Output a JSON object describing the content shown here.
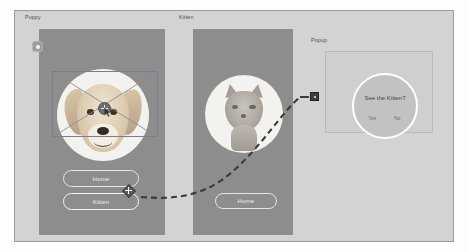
{
  "canvas": {
    "background_color": "#d3d3d3",
    "border_color": "#9a9a9a"
  },
  "frames": [
    {
      "name": "puppy-frame",
      "label": "Puppy",
      "is_home": true,
      "background_color": "#8d8d8d",
      "image_subject": "golden retriever puppy",
      "buttons": [
        {
          "name": "home-button",
          "label": "Home"
        },
        {
          "name": "kitten-button",
          "label": "Kitten",
          "has_connector": true
        }
      ]
    },
    {
      "name": "kitten-frame",
      "label": "Kitten",
      "is_home": false,
      "background_color": "#8d8d8d",
      "image_subject": "grey tabby kitten",
      "buttons": [
        {
          "name": "home-button",
          "label": "Home"
        }
      ]
    },
    {
      "name": "popup-frame",
      "label": "Popup",
      "background_color": "#cfcfcf",
      "modal": {
        "title": "See the Kitten?",
        "confirm_label": "Yes",
        "dismiss_label": "No"
      }
    }
  ],
  "connector": {
    "name": "kitten-button-to-popup",
    "style": "dashed",
    "color": "#3a3a3a",
    "source_handle": "move-plus-handle",
    "target_marker": "square-endpoint"
  },
  "selection": {
    "name": "image-placeholder-selection",
    "border_color": "#7c7c8e",
    "cross_lines": true,
    "handle": "move-cursor-handle"
  },
  "colors": {
    "artboard": "#8d8d8d",
    "canvas": "#d3d3d3",
    "button_outline": "#e4e4e4",
    "modal_ring": "#ffffff",
    "modal_fill": "#c2c2c2"
  }
}
